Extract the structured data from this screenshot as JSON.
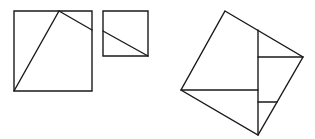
{
  "diagram": {
    "stroke_color": "#1a1a1a",
    "background": "#ffffff",
    "figures": [
      {
        "name": "large-square",
        "outline": [
          [
            14,
            11
          ],
          [
            92,
            11
          ],
          [
            92,
            91
          ],
          [
            14,
            91
          ]
        ],
        "cuts": [
          [
            [
              14,
              91
            ],
            [
              59,
              11
            ]
          ],
          [
            [
              59,
              11
            ],
            [
              92,
              30
            ]
          ]
        ]
      },
      {
        "name": "small-square",
        "outline": [
          [
            103,
            11
          ],
          [
            148,
            11
          ],
          [
            148,
            56
          ],
          [
            103,
            56
          ]
        ],
        "cuts": [
          [
            [
              103,
              31
            ],
            [
              148,
              56
            ]
          ]
        ]
      },
      {
        "name": "tilted-square",
        "outline": [
          [
            225,
            11
          ],
          [
            303,
            57
          ],
          [
            258,
            135
          ],
          [
            181,
            90
          ]
        ],
        "cuts": [
          [
            [
              258,
              30
            ],
            [
              258,
              135
            ]
          ],
          [
            [
              258,
              57
            ],
            [
              303,
              57
            ]
          ],
          [
            [
              181,
              90
            ],
            [
              258,
              90
            ]
          ],
          [
            [
              258,
              102
            ],
            [
              277,
              102
            ]
          ]
        ]
      }
    ]
  }
}
